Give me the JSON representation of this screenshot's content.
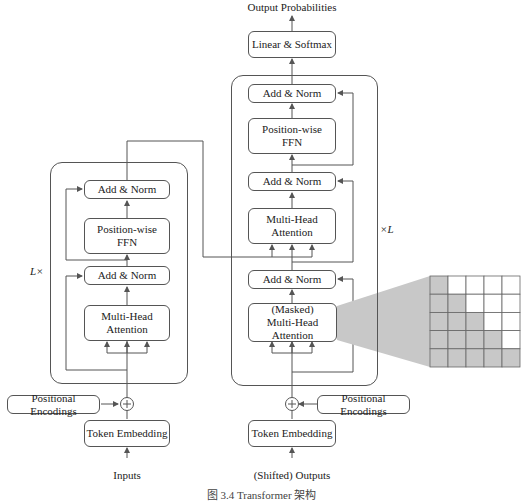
{
  "top_output_label": "Output Probabilities",
  "encoder": {
    "repeat_label": "L×",
    "add_norm_top": "Add & Norm",
    "ffn": [
      "Position-wise",
      "FFN"
    ],
    "add_norm_bottom": "Add & Norm",
    "attention": [
      "Multi-Head",
      "Attention"
    ],
    "positional_encodings": "Positional Encodings",
    "token_embedding": "Token Embedding",
    "input_label": "Inputs",
    "plus_symbol": "+"
  },
  "decoder": {
    "repeat_label": "×L",
    "linear_softmax": "Linear & Softmax",
    "add_norm_top": "Add & Norm",
    "ffn": [
      "Position-wise",
      "FFN"
    ],
    "add_norm_mid": "Add & Norm",
    "cross_attention": [
      "Multi-Head",
      "Attention"
    ],
    "add_norm_bottom": "Add & Norm",
    "masked_attention": [
      "(Masked)",
      "Multi-Head",
      "Attention"
    ],
    "positional_encodings": "Positional Encodings",
    "token_embedding": "Token Embedding",
    "input_label": "(Shifted) Outputs",
    "plus_symbol": "+"
  },
  "mask_matrix": {
    "size": 5,
    "pattern": "lower-triangular",
    "masked_color": "#c8c8c8",
    "unmasked_color": "#ffffff",
    "cells": [
      [
        1,
        0,
        0,
        0,
        0
      ],
      [
        1,
        1,
        0,
        0,
        0
      ],
      [
        1,
        1,
        1,
        0,
        0
      ],
      [
        1,
        1,
        1,
        1,
        0
      ],
      [
        1,
        1,
        1,
        1,
        1
      ]
    ]
  },
  "caption": "图 3.4   Transformer 架构",
  "colors": {
    "line": "#555555",
    "funnel": "#c8c8c8"
  }
}
